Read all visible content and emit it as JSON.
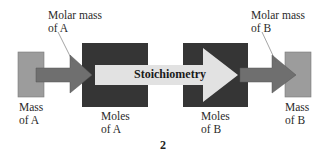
{
  "diagram": {
    "labels": {
      "molar_mass_a_line1": "Molar mass",
      "molar_mass_a_line2": "of A",
      "molar_mass_b_line1": "Molar mass",
      "molar_mass_b_line2": "of B",
      "mass_a_line1": "Mass",
      "mass_a_line2": "of A",
      "moles_a_line1": "Moles",
      "moles_a_line2": "of A",
      "moles_b_line1": "Moles",
      "moles_b_line2": "of B",
      "mass_b_line1": "Mass",
      "mass_b_line2": "of B",
      "center_arrow": "Stoichiometry"
    },
    "figure_number": "2",
    "colors": {
      "mass_box": "#9c9c9c",
      "moles_box": "#353535",
      "small_arrow": "#6f6f6f",
      "stoich_arrow": "#e2e2e2",
      "leader_line": "#666666"
    }
  }
}
